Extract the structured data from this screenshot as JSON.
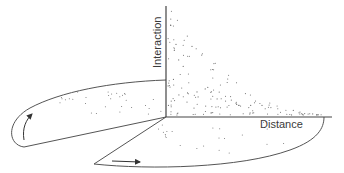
{
  "diagram": {
    "axes": {
      "y_label": "Interaction",
      "x_label": "Distance"
    },
    "colors": {
      "line": "#555555",
      "dots": "#6a6a6a",
      "text": "#3a3a3a"
    },
    "arrows": [
      {
        "name": "curved-arrow-up",
        "direction": "up"
      },
      {
        "name": "straight-arrow-right",
        "direction": "right"
      }
    ]
  }
}
